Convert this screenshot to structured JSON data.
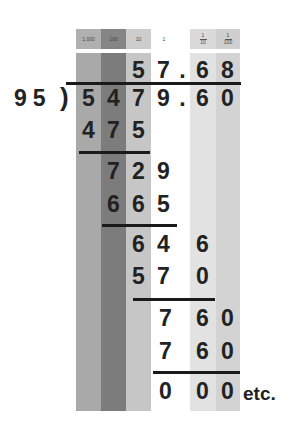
{
  "headers": {
    "thousands": "1,000",
    "hundreds": "100",
    "tens": "10",
    "ones": "1",
    "tenths": {
      "num": "1",
      "den": "10"
    },
    "hundredths": {
      "num": "1",
      "den": "100"
    }
  },
  "colors": {
    "thousands": "#a9a9a9",
    "hundreds": "#7c7c7c",
    "tens": "#c6c6c6",
    "ones": "#ffffff",
    "tenths": "#e2e2e2",
    "hundredths": "#d3d3d3",
    "ink": "#222222"
  },
  "problem": {
    "divisor": "95",
    "paren": ")",
    "dividend": [
      "5",
      "4",
      "7",
      "9",
      ".",
      "6",
      "0"
    ],
    "quotient": [
      "5",
      "7",
      ".",
      "6",
      "8"
    ]
  },
  "steps": {
    "s1": [
      "4",
      "7",
      "5"
    ],
    "s2": [
      "7",
      "2",
      "9"
    ],
    "s3": [
      "6",
      "6",
      "5"
    ],
    "s4": [
      "6",
      "4",
      "6"
    ],
    "s5": [
      "5",
      "7",
      "0"
    ],
    "s6": [
      "7",
      "6",
      "0"
    ],
    "s7": [
      "7",
      "6",
      "0"
    ],
    "s8": [
      "0",
      "0",
      "0"
    ]
  },
  "etc": "etc."
}
